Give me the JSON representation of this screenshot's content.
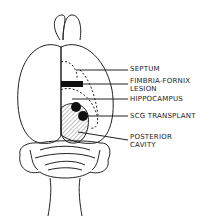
{
  "diagram": {
    "labels": [
      {
        "id": "septum",
        "text": "SEPTUM"
      },
      {
        "id": "fimbria_fornix_1",
        "text": "FIMBRIA-FORNIX"
      },
      {
        "id": "fimbria_fornix_2",
        "text": "LESION"
      },
      {
        "id": "hippocampus",
        "text": "HIPPOCAMPUS"
      },
      {
        "id": "scg",
        "text": "SCG  TRANSPLANT"
      },
      {
        "id": "posterior_1",
        "text": "POSTERIOR"
      },
      {
        "id": "posterior_2",
        "text": "CAVITY"
      }
    ],
    "colors": {
      "line": "#222222",
      "fill": "#111111",
      "background": "#ffffff"
    }
  }
}
